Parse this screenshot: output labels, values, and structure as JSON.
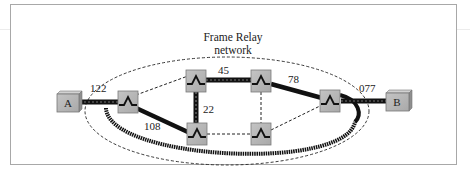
{
  "diagram": {
    "title_line1": "Frame Relay",
    "title_line2": "network",
    "endpoints": [
      {
        "id": "A",
        "label": "A"
      },
      {
        "id": "B",
        "label": "B"
      }
    ],
    "switches": [
      "S1",
      "S2",
      "S3",
      "S4",
      "S5",
      "S6"
    ],
    "links": [
      {
        "from": "A",
        "to": "S1",
        "dlci": "122",
        "style": "access-thick-dashed"
      },
      {
        "from": "S1",
        "to": "S2",
        "dlci": "",
        "style": "dashed"
      },
      {
        "from": "S1",
        "to": "S4",
        "dlci": "108",
        "style": "thick-path"
      },
      {
        "from": "S2",
        "to": "S3",
        "dlci": "45",
        "style": "thick-path"
      },
      {
        "from": "S2",
        "to": "S4",
        "dlci": "22",
        "style": "thick-path"
      },
      {
        "from": "S3",
        "to": "S6",
        "dlci": "78",
        "style": "thick-path"
      },
      {
        "from": "S3",
        "to": "S5",
        "dlci": "",
        "style": "dashed"
      },
      {
        "from": "S4",
        "to": "S5",
        "dlci": "",
        "style": "dashed"
      },
      {
        "from": "S5",
        "to": "S6",
        "dlci": "",
        "style": "dashed"
      },
      {
        "from": "S6",
        "to": "B",
        "dlci": "077",
        "style": "access-thick-dashed"
      }
    ],
    "labels": {
      "dlci_122": "122",
      "dlci_108": "108",
      "dlci_45": "45",
      "dlci_22": "22",
      "dlci_78": "78",
      "dlci_077": "077"
    },
    "colors": {
      "node_fill": "#b8b8b8",
      "node_border": "#7a7a7a",
      "path": "#1a1a1a",
      "frame": "#a8a8a8"
    }
  }
}
